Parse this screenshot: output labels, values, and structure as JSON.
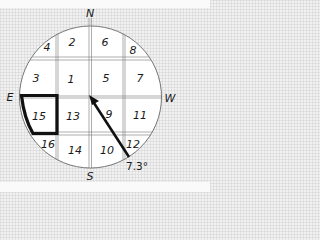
{
  "diagram": {
    "type": "compass-grid",
    "directions": {
      "north": "N",
      "south": "S",
      "east": "E",
      "west": "W"
    },
    "cells": [
      {
        "id": "4",
        "label": "4"
      },
      {
        "id": "2",
        "label": "2"
      },
      {
        "id": "6",
        "label": "6"
      },
      {
        "id": "8",
        "label": "8"
      },
      {
        "id": "3",
        "label": "3"
      },
      {
        "id": "1",
        "label": "1"
      },
      {
        "id": "5",
        "label": "5"
      },
      {
        "id": "7",
        "label": "7"
      },
      {
        "id": "15",
        "label": "15"
      },
      {
        "id": "13",
        "label": "13"
      },
      {
        "id": "9",
        "label": "9"
      },
      {
        "id": "11",
        "label": "11"
      },
      {
        "id": "16",
        "label": "16"
      },
      {
        "id": "14",
        "label": "14"
      },
      {
        "id": "10",
        "label": "10"
      },
      {
        "id": "12",
        "label": "12"
      }
    ],
    "highlighted_cell": "15",
    "arrow": {
      "angle_label": "7.3°"
    },
    "colors": {
      "ink": "#1a1a1a",
      "circle_fill": "#ffffff",
      "background": "#f1f1f1"
    }
  }
}
